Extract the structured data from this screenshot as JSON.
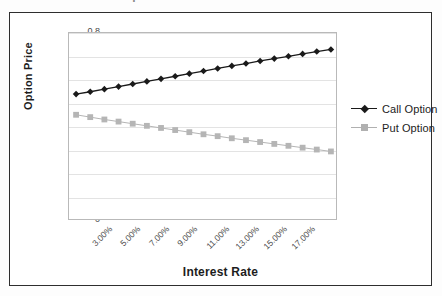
{
  "title_clipped": "Option Prices versus Interest Rate",
  "axis": {
    "y_label": "Option Price",
    "x_label": "Interest Rate",
    "y_ticks": [
      "0.8",
      "0.7",
      "0.6",
      "0.5",
      "0.4",
      "0.3",
      "0.2",
      "0.1",
      "0"
    ],
    "x_ticks": [
      "3.00%",
      "5.00%",
      "7.00%",
      "9.00%",
      "11.00%",
      "13.00%",
      "15.00%",
      "17.00%"
    ]
  },
  "legend": {
    "items": [
      {
        "label": "Call Option",
        "color": "#1a1a1a",
        "marker": "diamond"
      },
      {
        "label": "Put Option",
        "color": "#b0b0b0",
        "marker": "square"
      }
    ]
  },
  "colors": {
    "call": "#1a1a1a",
    "put": "#b5b5b5",
    "grid": "#e3e3e3",
    "plot_border": "#b9b9b9",
    "frame": "#2e2e2e",
    "text": "#4a4a4a"
  },
  "chart_data": {
    "type": "line",
    "title": "Option Prices versus Interest Rate",
    "xlabel": "Interest Rate",
    "ylabel": "Option Price",
    "ylim": [
      0,
      0.8
    ],
    "y_tick_step": 0.1,
    "grid": true,
    "legend_position": "right",
    "categories": [
      "3.00%",
      "4.00%",
      "5.00%",
      "6.00%",
      "7.00%",
      "8.00%",
      "9.00%",
      "10.00%",
      "11.00%",
      "12.00%",
      "13.00%",
      "14.00%",
      "15.00%",
      "16.00%",
      "17.00%",
      "18.00%",
      "19.00%",
      "20.00%",
      "21.00%"
    ],
    "x_numeric": [
      3,
      4,
      5,
      6,
      7,
      8,
      9,
      10,
      11,
      12,
      13,
      14,
      15,
      16,
      17,
      18,
      19,
      20,
      21
    ],
    "series": [
      {
        "name": "Call Option",
        "marker": "diamond",
        "color": "#1a1a1a",
        "values": [
          0.54,
          0.55,
          0.561,
          0.572,
          0.583,
          0.594,
          0.605,
          0.616,
          0.627,
          0.638,
          0.649,
          0.66,
          0.67,
          0.681,
          0.691,
          0.701,
          0.711,
          0.721,
          0.73
        ]
      },
      {
        "name": "Put Option",
        "marker": "square",
        "color": "#b5b5b5",
        "values": [
          0.452,
          0.442,
          0.432,
          0.423,
          0.414,
          0.405,
          0.396,
          0.387,
          0.378,
          0.369,
          0.361,
          0.352,
          0.344,
          0.336,
          0.328,
          0.32,
          0.312,
          0.304,
          0.296
        ]
      }
    ]
  }
}
